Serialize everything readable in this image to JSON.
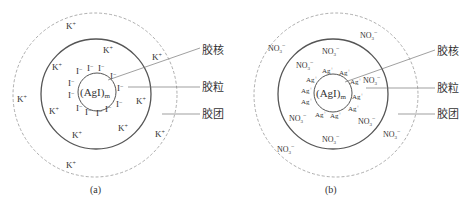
{
  "figure": {
    "panels": [
      {
        "id": "a",
        "caption": "(a)",
        "core": "(AgI)",
        "core_sub": "m",
        "potential_ions": "I",
        "potential_charge": "−",
        "counter_ion": "K",
        "counter_charge": "+"
      },
      {
        "id": "b",
        "caption": "(b)",
        "core": "(AgI)",
        "core_sub": "m",
        "potential_ions": "Ag",
        "potential_charge": "+",
        "counter_ion": "NO",
        "counter_sub": "3",
        "counter_charge": "−"
      }
    ],
    "labels": {
      "core": "胶核",
      "particle": "胶粒",
      "micelle": "胶团"
    }
  }
}
